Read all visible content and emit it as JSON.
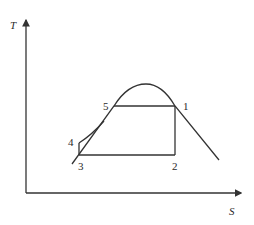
{
  "diagram": {
    "type": "T-s diagram",
    "axes": {
      "y_label": "T",
      "x_label": "S"
    },
    "points": [
      {
        "id": "1",
        "label": "1"
      },
      {
        "id": "2",
        "label": "2"
      },
      {
        "id": "3",
        "label": "3"
      },
      {
        "id": "4",
        "label": "4"
      },
      {
        "id": "5",
        "label": "5"
      }
    ],
    "colors": {
      "line": "#333333",
      "background": "#ffffff"
    }
  }
}
